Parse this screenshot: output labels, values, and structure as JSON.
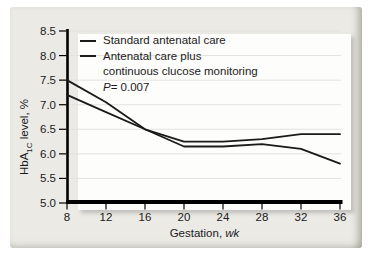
{
  "colors": {
    "panel_bg": "#ebeae5",
    "plot_bg": "#fdfdfc",
    "grid": "#e3e2de",
    "axis": "#000000",
    "line": "#1a1a1a",
    "text": "#1b1b1b"
  },
  "chart_data": {
    "type": "line",
    "x": [
      8,
      12,
      16,
      20,
      24,
      28,
      32,
      36
    ],
    "x_tick_labels": [
      "8",
      "12",
      "16",
      "20",
      "24",
      "28",
      "32",
      "36"
    ],
    "y_tick_labels": [
      "8.5",
      "8.0",
      "7.5",
      "7.0",
      "6.5",
      "6.0",
      "5.5",
      "5.0"
    ],
    "xlim": [
      8,
      36
    ],
    "ylim": [
      5.0,
      8.5
    ],
    "grid": true,
    "series": [
      {
        "name": "Standard antenatal care",
        "values": [
          7.2,
          6.85,
          6.5,
          6.25,
          6.25,
          6.3,
          6.4,
          6.4
        ],
        "color": "#1a1a1a"
      },
      {
        "name": "Antenatal care plus continuous clucose monitoring",
        "values": [
          7.5,
          7.05,
          6.5,
          6.15,
          6.15,
          6.2,
          6.1,
          5.8
        ],
        "color": "#1a1a1a"
      }
    ],
    "ylabel": {
      "prefix": "HbA",
      "sub": "1C",
      "suffix": " level, %"
    },
    "xlabel": {
      "prefix": "Gestation, ",
      "unit": "wk"
    },
    "annotation": {
      "label": "P",
      "value": " = 0.007"
    },
    "legend": {
      "position": "top-left",
      "items": [
        {
          "line1": "Standard antenatal care",
          "line2": ""
        },
        {
          "line1": "Antenatal care plus",
          "line2": "continuous clucose monitoring"
        }
      ]
    }
  }
}
